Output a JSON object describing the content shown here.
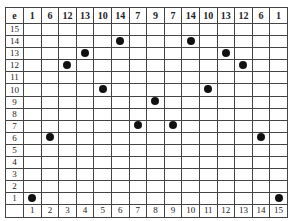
{
  "table": {
    "corner_label": "e",
    "header_values": [
      "1",
      "6",
      "12",
      "13",
      "10",
      "14",
      "7",
      "9",
      "7",
      "14",
      "10",
      "13",
      "12",
      "6",
      "1"
    ],
    "row_labels": [
      "15",
      "14",
      "13",
      "12",
      "11",
      "10",
      "9",
      "8",
      "7",
      "6",
      "5",
      "4",
      "3",
      "2",
      "1"
    ],
    "column_labels": [
      "1",
      "2",
      "3",
      "4",
      "5",
      "6",
      "7",
      "8",
      "9",
      "10",
      "11",
      "12",
      "13",
      "14",
      "15"
    ],
    "dots": [
      {
        "col": 1,
        "row": 1
      },
      {
        "col": 2,
        "row": 6
      },
      {
        "col": 3,
        "row": 12
      },
      {
        "col": 4,
        "row": 13
      },
      {
        "col": 5,
        "row": 10
      },
      {
        "col": 6,
        "row": 14
      },
      {
        "col": 7,
        "row": 7
      },
      {
        "col": 8,
        "row": 9
      },
      {
        "col": 9,
        "row": 7
      },
      {
        "col": 10,
        "row": 14
      },
      {
        "col": 11,
        "row": 10
      },
      {
        "col": 12,
        "row": 13
      },
      {
        "col": 13,
        "row": 12
      },
      {
        "col": 14,
        "row": 6
      },
      {
        "col": 15,
        "row": 1
      }
    ],
    "dot_color": "#111111"
  }
}
